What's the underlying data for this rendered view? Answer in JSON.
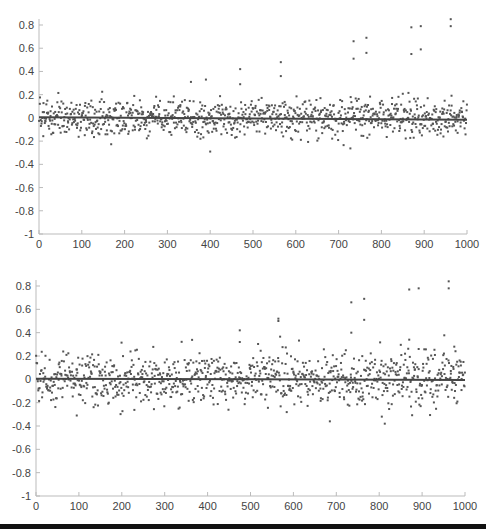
{
  "chart_data": [
    {
      "type": "scatter",
      "title": "",
      "xlabel": "",
      "ylabel": "",
      "xlim": [
        0,
        1000
      ],
      "ylim": [
        -1,
        0.8
      ],
      "x_ticks": [
        0,
        100,
        200,
        300,
        400,
        500,
        600,
        700,
        800,
        900,
        1000
      ],
      "y_ticks": [
        0.8,
        0.6,
        0.4,
        0.2,
        0,
        -0.2,
        -0.4,
        -0.6,
        -0.8,
        -1
      ],
      "y_tick_labels": [
        "0.8",
        "0.6",
        "0.4",
        "0.2",
        "0",
        "-0.2",
        "-0.4",
        "-0.6",
        "-0.8",
        "-1"
      ],
      "grid": false,
      "legend": null,
      "series": [
        {
          "name": "samples",
          "marker": "dot",
          "color": "#555555",
          "n_points": 1000,
          "noise_std": 0.08,
          "noise_clip": 0.3,
          "seed": 7,
          "outliers": [
            {
              "x": 470,
              "y": 0.42
            },
            {
              "x": 470,
              "y": 0.29
            },
            {
              "x": 565,
              "y": 0.48
            },
            {
              "x": 565,
              "y": 0.36
            },
            {
              "x": 735,
              "y": 0.66
            },
            {
              "x": 735,
              "y": 0.51
            },
            {
              "x": 765,
              "y": 0.69
            },
            {
              "x": 765,
              "y": 0.56
            },
            {
              "x": 870,
              "y": 0.78
            },
            {
              "x": 870,
              "y": 0.55
            },
            {
              "x": 892,
              "y": 0.79
            },
            {
              "x": 892,
              "y": 0.59
            },
            {
              "x": 962,
              "y": 0.85
            },
            {
              "x": 962,
              "y": 0.79
            },
            {
              "x": 400,
              "y": -0.29
            },
            {
              "x": 355,
              "y": 0.31
            },
            {
              "x": 390,
              "y": 0.33
            }
          ]
        },
        {
          "name": "fit-line",
          "type": "line",
          "color": "#444444",
          "x": [
            0,
            1000
          ],
          "y": [
            0.005,
            -0.015
          ]
        }
      ]
    },
    {
      "type": "scatter",
      "title": "",
      "xlabel": "",
      "ylabel": "",
      "xlim": [
        0,
        1000
      ],
      "ylim": [
        -1,
        0.8
      ],
      "x_ticks": [
        0,
        100,
        200,
        300,
        400,
        500,
        600,
        700,
        800,
        900,
        1000
      ],
      "y_ticks": [
        0.8,
        0.6,
        0.4,
        0.2,
        0,
        -0.2,
        -0.4,
        -0.6,
        -0.8,
        -1
      ],
      "y_tick_labels": [
        "0.8",
        "0.6",
        "0.4",
        "0.2",
        "0",
        "-0.2",
        "-0.4",
        "-0.6",
        "-0.8",
        "-1"
      ],
      "grid": false,
      "legend": null,
      "series": [
        {
          "name": "samples",
          "marker": "dot",
          "color": "#555555",
          "n_points": 1000,
          "noise_std": 0.12,
          "noise_clip": 0.38,
          "seed": 19,
          "outliers": [
            {
              "x": 475,
              "y": 0.42
            },
            {
              "x": 475,
              "y": 0.32
            },
            {
              "x": 565,
              "y": 0.52
            },
            {
              "x": 565,
              "y": 0.5
            },
            {
              "x": 735,
              "y": 0.66
            },
            {
              "x": 735,
              "y": 0.4
            },
            {
              "x": 765,
              "y": 0.69
            },
            {
              "x": 765,
              "y": 0.51
            },
            {
              "x": 870,
              "y": 0.77
            },
            {
              "x": 870,
              "y": 0.34
            },
            {
              "x": 892,
              "y": 0.78
            },
            {
              "x": 892,
              "y": 0.26
            },
            {
              "x": 962,
              "y": 0.84
            },
            {
              "x": 962,
              "y": 0.78
            },
            {
              "x": 975,
              "y": 0.28
            },
            {
              "x": 813,
              "y": -0.38
            },
            {
              "x": 685,
              "y": -0.36
            },
            {
              "x": 95,
              "y": -0.31
            }
          ]
        },
        {
          "name": "fit-line",
          "type": "line",
          "color": "#444444",
          "x": [
            0,
            1000
          ],
          "y": [
            0.005,
            -0.005
          ]
        }
      ]
    }
  ]
}
